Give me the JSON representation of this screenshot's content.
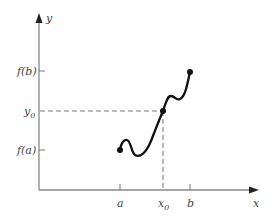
{
  "diagram": {
    "type": "function-graph",
    "axes": {
      "x_label": "x",
      "y_label": "y",
      "color": "#888888"
    },
    "x_ticks": {
      "a": "a",
      "x0_base": "x",
      "x0_sub": "0",
      "b": "b"
    },
    "y_ticks": {
      "fb": "f(b)",
      "y0_base": "y",
      "y0_sub": "0",
      "fa": "f(a)"
    },
    "points": [
      {
        "name": "(a, f(a))",
        "x": 120,
        "y": 150
      },
      {
        "name": "(x0, y0)",
        "x": 163,
        "y": 111
      },
      {
        "name": "(b, f(b))",
        "x": 190,
        "y": 72
      }
    ],
    "curve_color": "#111111",
    "dash_color": "#777777"
  }
}
